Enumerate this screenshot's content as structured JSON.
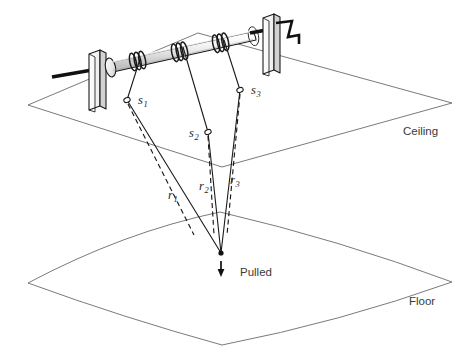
{
  "figure": {
    "background_color": "#ffffff",
    "line_color": "#1a1a1a",
    "plane_color": "#6b6b6b",
    "label_color": "#3a3a3a",
    "width": 472,
    "height": 361
  },
  "planes": {
    "ceiling": {
      "label": "Ceiling",
      "label_x": 403,
      "label_y": 131,
      "type": "flat-parallelogram",
      "corners": [
        [
          28,
          105
        ],
        [
          198,
          33
        ],
        [
          452,
          103
        ],
        [
          222,
          167
        ]
      ]
    },
    "floor": {
      "label": "Floor",
      "label_x": 409,
      "label_y": 301,
      "type": "curved-quadrilateral",
      "corners": [
        [
          28,
          283
        ],
        [
          220,
          212
        ],
        [
          452,
          282
        ],
        [
          222,
          345
        ]
      ]
    }
  },
  "attachment_points": [
    {
      "name": "s1",
      "label": "s",
      "subscript": "1",
      "marker_x": 127,
      "marker_y": 100,
      "label_x": 138,
      "label_y": 104
    },
    {
      "name": "s2",
      "label": "s",
      "subscript": "2",
      "marker_x": 208,
      "marker_y": 132,
      "label_x": 189,
      "label_y": 137
    },
    {
      "name": "s3",
      "label": "s",
      "subscript": "3",
      "marker_x": 240,
      "marker_y": 90,
      "label_x": 251,
      "label_y": 94
    }
  ],
  "cables": [
    {
      "name": "r1",
      "label": "r",
      "subscript": "1",
      "label_x": 168,
      "label_y": 199,
      "drum_x": 140,
      "drum_y": 59,
      "sensor_x": 127,
      "sensor_y": 100,
      "end_x": 221,
      "end_y": 253
    },
    {
      "name": "r2",
      "label": "r",
      "subscript": "2",
      "label_x": 199,
      "label_y": 190,
      "drum_x": 183,
      "drum_y": 43,
      "sensor_x": 208,
      "sensor_y": 132,
      "end_x": 221,
      "end_y": 253
    },
    {
      "name": "r3",
      "label": "r",
      "subscript": "3",
      "label_x": 230,
      "label_y": 184,
      "drum_x": 224,
      "drum_y": 36,
      "sensor_x": 240,
      "sensor_y": 90,
      "end_x": 221,
      "end_y": 253
    }
  ],
  "pull_point": {
    "label": "Pulled",
    "label_x": 240,
    "label_y": 272,
    "point_x": 221,
    "point_y": 253,
    "arrow_tip_x": 221,
    "arrow_tip_y": 276
  },
  "mechanism": {
    "drum_name": "winch-drum",
    "left_mount_name": "left-support-plate",
    "right_mount_name": "right-support-plate",
    "crank_name": "crank-handle",
    "axle_name": "axle-rod",
    "winding_groups": 3,
    "winding_bands_per_group": 3,
    "drum_fill_light": "#f7f7f7",
    "drum_fill_mid": "#d8d8d8",
    "plate_fill": "#fdfdfd",
    "plate_shade": "#cfcfcf"
  }
}
